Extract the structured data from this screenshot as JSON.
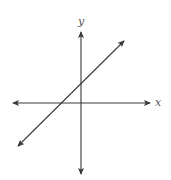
{
  "figure": {
    "type": "coordinate-plane-line-graph",
    "x_axis_label": "x",
    "y_axis_label": "y",
    "colors": {
      "axis": "#3a3a3a",
      "line": "#3a3a3a",
      "label": "#555555",
      "background": "#ffffff"
    },
    "line": {
      "description": "Straight line with positive slope, arrows on both ends",
      "slope_sign": "positive",
      "y_intercept_sign": "positive",
      "x_intercept_sign": "negative"
    }
  }
}
